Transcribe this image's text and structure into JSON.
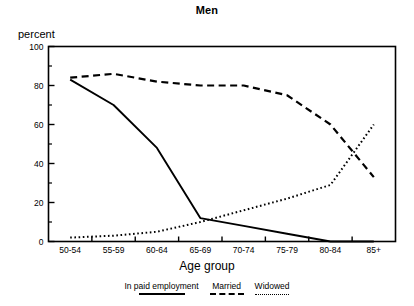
{
  "chart_data": {
    "type": "line",
    "title": "Men",
    "xlabel": "Age group",
    "ylabel": "percent",
    "categories": [
      "50-54",
      "55-59",
      "60-64",
      "65-69",
      "70-74",
      "75-79",
      "80-84",
      "85+"
    ],
    "ylim": [
      0,
      100
    ],
    "ytick_labels": [
      "0",
      "20",
      "40",
      "60",
      "80",
      "100"
    ],
    "ytick_values": [
      0,
      20,
      40,
      60,
      80,
      100
    ],
    "yminor_values": [
      10,
      30,
      50,
      70,
      90
    ],
    "grid": false,
    "legend_position": "below",
    "series": [
      {
        "name": "In paid employment",
        "style": "solid",
        "values": [
          83,
          70,
          48,
          12,
          8,
          4,
          0,
          0
        ]
      },
      {
        "name": "Married",
        "style": "dashed",
        "values": [
          84,
          86,
          82,
          80,
          80,
          75,
          60,
          33
        ]
      },
      {
        "name": "Widowed",
        "style": "dotted",
        "values": [
          2,
          3,
          5,
          10,
          16,
          22,
          29,
          60
        ]
      }
    ]
  },
  "legend": {
    "items": [
      {
        "label": "In paid employment",
        "style": "solid"
      },
      {
        "label": "Married",
        "style": "dashed"
      },
      {
        "label": "Widowed",
        "style": "dotted"
      }
    ]
  }
}
